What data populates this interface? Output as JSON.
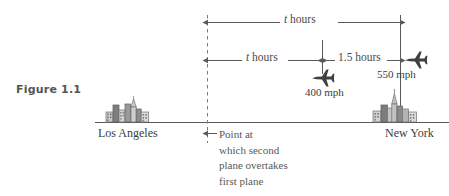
{
  "figure": {
    "caption": "Figure 1.1",
    "type": "number-line-distance-diagram"
  },
  "axis": {
    "baseline_label_left": "Los Angeles",
    "baseline_label_right": "New York"
  },
  "measures": [
    {
      "name": "total-time",
      "italic_symbol": "t",
      "unit_text": " hours",
      "full_text": "t hours"
    },
    {
      "name": "first-segment-time",
      "italic_symbol": "t",
      "unit_text": " hours",
      "full_text": "t hours"
    },
    {
      "name": "second-segment-time",
      "value": "1.5",
      "unit_text": " hours",
      "full_text": "1.5 hours"
    }
  ],
  "planes": [
    {
      "name": "first-plane",
      "speed_label": "400 mph",
      "speed_value": 400,
      "speed_unit": "mph"
    },
    {
      "name": "second-plane",
      "speed_label": "550 mph",
      "speed_value": 550,
      "speed_unit": "mph"
    }
  ],
  "annotation": {
    "overtake_lines": [
      "Point at",
      "which second",
      "plane overtakes",
      "first plane"
    ]
  },
  "colors": {
    "ink": "#4a4a4a",
    "line": "#5a5a5a",
    "building_fill": "#b9b9b9",
    "building_dark": "#6f6f6f",
    "background": "#ffffff"
  }
}
